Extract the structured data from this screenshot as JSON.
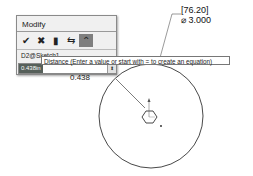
{
  "dialog": {
    "title": "Modify",
    "toolbar": [
      {
        "icon": "check-icon",
        "glyph": "✔"
      },
      {
        "icon": "close-icon",
        "glyph": "✖"
      },
      {
        "icon": "rebuild-icon",
        "glyph": "▮"
      },
      {
        "icon": "reverse-icon",
        "glyph": "⇆"
      },
      {
        "icon": "mark-dimension-icon",
        "glyph": "⌃"
      }
    ],
    "dimension_name": "D2@Sketch1",
    "value": "0.438in",
    "spin_glyph": "⬍"
  },
  "tooltip": "Distance (Enter a value or start with = to create an equation)",
  "dimension_label": {
    "line1": "[76.20]",
    "line2": "⌀ 3.000"
  },
  "partial_dimension": "0.438",
  "colors": {
    "sketch_line": "#333333",
    "selection": "#56605a"
  }
}
